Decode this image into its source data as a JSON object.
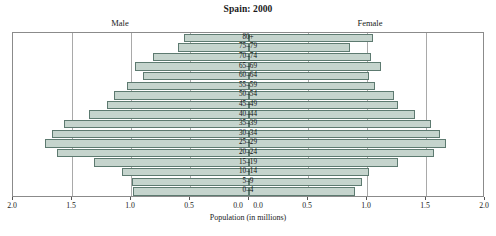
{
  "chart_data": {
    "type": "bar",
    "subtype": "population-pyramid",
    "title": "Spain: 2000",
    "xlabel": "Population (in millions)",
    "ylabel": "",
    "grid": true,
    "legend_position": "above-plot",
    "axis_max": 2.0,
    "categories": [
      "80+",
      "75–79",
      "70–74",
      "65–69",
      "60–64",
      "55–59",
      "50–54",
      "45–49",
      "40–44",
      "35–39",
      "30–34",
      "25–29",
      "20–24",
      "15–19",
      "10–14",
      "5–9",
      "0–4"
    ],
    "series": [
      {
        "name": "Male",
        "side": "left",
        "values": [
          0.55,
          0.6,
          0.81,
          0.97,
          0.9,
          1.03,
          1.14,
          1.2,
          1.36,
          1.57,
          1.67,
          1.73,
          1.63,
          1.31,
          1.08,
          0.99,
          0.98
        ]
      },
      {
        "name": "Female",
        "side": "right",
        "values": [
          1.05,
          0.86,
          1.03,
          1.12,
          1.02,
          1.07,
          1.23,
          1.26,
          1.41,
          1.54,
          1.62,
          1.67,
          1.57,
          1.26,
          1.02,
          0.96,
          0.9
        ]
      }
    ],
    "xticks_left": [
      "2.0",
      "1.5",
      "1.0",
      "0.5",
      "0.0"
    ],
    "xticks_right": [
      "0.0",
      "0.5",
      "1.0",
      "1.5",
      "2.0"
    ],
    "colors": {
      "bar_fill": "#c5d4cd",
      "bar_stroke": "#5d7a70",
      "grid": "#a9a9a9",
      "frame": "#8b8b8b",
      "text": "#1a1a1a",
      "background": "#ffffff"
    }
  }
}
